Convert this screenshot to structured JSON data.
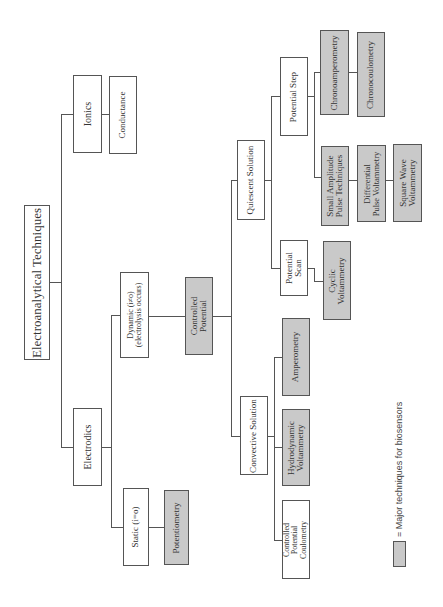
{
  "diagram": {
    "title": "Electroanalytical Techniques",
    "orientation": "rotated-90-ccw",
    "colors": {
      "major": "#c9c9c9",
      "normal": "#ffffff",
      "line": "#555555"
    },
    "nodes": {
      "root": "Electroanalytical Techniques",
      "ionics": "Ionics",
      "conductance": "Conductance",
      "electrodics": "Electrodics",
      "dynamic": "Dynamic (i≠o)\n(electrolysis occurs)",
      "static": "Static (i=o)",
      "potentiometry": "Potentiometry",
      "controlled_potential": "Controlled\nPotential",
      "quiescent": "Quiescent Solution",
      "potential_step": "Potential Step",
      "potential_scan": "Potential\nScan",
      "chronoamperometry": "Chronoamperometry",
      "chronocoulometry": "Chronocoulometry",
      "small_amplitude": "Small Amplitude\nPulse Techniques",
      "differential_pulse": "Differential\nPulse Voltammetry",
      "square_wave": "Square Wave\nVoltammetry",
      "cyclic": "Cyclic\nVoltammetry",
      "convective": "Convective Solution",
      "amperometry": "Amperometry",
      "hydrodynamic": "Hydrodynamic\nVoltammetry",
      "cp_coulometry": "Controlled\nPotential\nCoulometry"
    },
    "major_techniques": [
      "Potentiometry",
      "Controlled Potential",
      "Chronoamperometry",
      "Chronocoulometry",
      "Small Amplitude Pulse Techniques",
      "Differential Pulse Voltammetry",
      "Square Wave Voltammetry",
      "Cyclic Voltammetry",
      "Amperometry",
      "Hydrodynamic Voltammetry"
    ],
    "legend": {
      "text": "= Major techniques for biosensors"
    }
  }
}
